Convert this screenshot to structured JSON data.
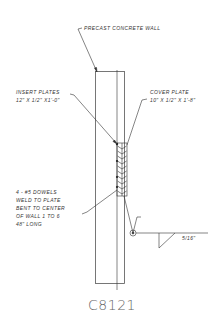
{
  "drawing": {
    "labels": {
      "wall": "PRECAST CONCRETE WALL",
      "insert_plates_title": "INSERT PLATES",
      "insert_plates_dims": "12\" X 1/2\" X1'-0\"",
      "cover_plate_title": "COVER PLATE",
      "cover_plate_dims": "10\" X 1/2\" X 1'-8\"",
      "dowels_line1": "4 - #5 DOWELS",
      "dowels_line2": "WELD TO PLATE",
      "dowels_line3": "BENT TO CENTER",
      "dowels_line4": "OF WALL 1 TO 6",
      "dowels_line5": "48\" LONG",
      "weld_size": "5/16\""
    },
    "detail_code": "C8121",
    "colors": {
      "line": "#333333",
      "text": "#333333",
      "code_text": "#666666",
      "background": "#ffffff"
    }
  }
}
